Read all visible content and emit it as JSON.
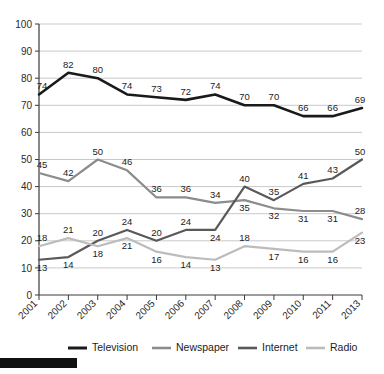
{
  "chart_data": {
    "type": "line",
    "title": "",
    "subtitle": "",
    "xlabel": "",
    "ylabel": "",
    "ylim": [
      0,
      100
    ],
    "ytick_step": 10,
    "grid": true,
    "legend_position": "bottom",
    "categories": [
      "2001",
      "2002",
      "2003",
      "2004",
      "2005",
      "2006",
      "2007",
      "2008",
      "2009",
      "2010",
      "2011",
      "2013"
    ],
    "yticks": [
      "0",
      "10",
      "20",
      "30",
      "40",
      "50",
      "60",
      "70",
      "80",
      "90",
      "100"
    ],
    "series": [
      {
        "name": "Television",
        "color": "#1a1a1a",
        "values": [
          74,
          82,
          80,
          74,
          73,
          72,
          74,
          70,
          70,
          66,
          66,
          69
        ],
        "label_offsets": [
          -1,
          -1,
          -1,
          -1,
          -1,
          -1,
          -1,
          -1,
          -1,
          -1,
          -1,
          -1
        ]
      },
      {
        "name": "Newspaper",
        "color": "#8c8c8c",
        "values": [
          45,
          42,
          50,
          46,
          36,
          36,
          34,
          35,
          32,
          31,
          31,
          28
        ],
        "label_offsets": [
          -1,
          -1,
          -1,
          -1,
          -1,
          -1,
          -1,
          1,
          1,
          1,
          1,
          -1
        ]
      },
      {
        "name": "Internet",
        "color": "#595959",
        "values": [
          13,
          14,
          20,
          24,
          20,
          24,
          24,
          40,
          35,
          41,
          43,
          50
        ],
        "label_offsets": [
          1,
          1,
          -1,
          -1,
          -1,
          -1,
          1,
          -1,
          -1,
          -1,
          -1,
          -1
        ]
      },
      {
        "name": "Radio",
        "color": "#bcbcbc",
        "values": [
          18,
          21,
          18,
          21,
          16,
          14,
          13,
          18,
          17,
          16,
          16,
          23
        ],
        "label_offsets": [
          -1,
          -1,
          1,
          1,
          1,
          1,
          1,
          -1,
          1,
          1,
          1,
          1
        ]
      }
    ]
  },
  "legend": {
    "items": [
      {
        "label": "Television",
        "color": "#1a1a1a"
      },
      {
        "label": "Newspaper",
        "color": "#8c8c8c"
      },
      {
        "label": "Internet",
        "color": "#595959"
      },
      {
        "label": "Radio",
        "color": "#bcbcbc"
      }
    ]
  },
  "footer": {
    "black_bar": ""
  }
}
